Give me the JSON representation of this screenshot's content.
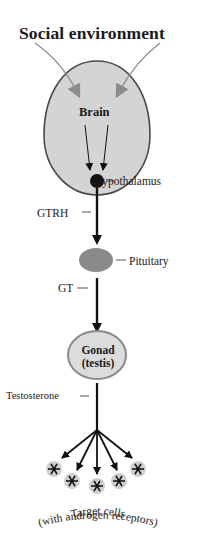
{
  "diagram": {
    "title": "Social environment",
    "nodes": {
      "brain": {
        "label": "Brain"
      },
      "hypothalamus": {
        "label": "Hypothalamus"
      },
      "pituitary": {
        "label": "Pituitary"
      },
      "gonad": {
        "label_line1": "Gonad",
        "label_line2": "(testis)"
      },
      "target_cells": {
        "label_line1": "Target cells",
        "label_line2": "(with androgen receptors)"
      }
    },
    "hormones": {
      "gtrh": "GTRH",
      "gt": "GT",
      "testosterone": "Testosterone"
    },
    "colors": {
      "brain_fill": "#d4d4d4",
      "brain_stroke": "#4a4a4a",
      "env_arrow": "#8c8c8c",
      "hypothalamus": "#111111",
      "pituitary": "#8a8a8a",
      "gonad_fill": "#dcdcdc",
      "gonad_stroke": "#8a8a8a",
      "pathway": "#111111",
      "cell_halo": "#cfcfcf"
    },
    "target_cell_count": 5
  }
}
